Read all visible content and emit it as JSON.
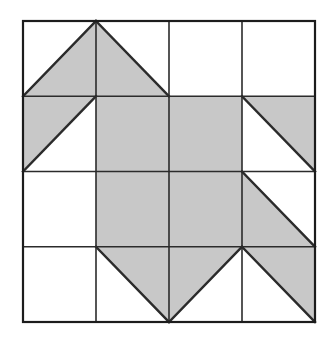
{
  "figure": {
    "type": "geometric-grid-diagram",
    "canvas": {
      "width": 333,
      "height": 337
    },
    "colors": {
      "background": "#ffffff",
      "shade_fill": "#c8c8c8",
      "blank_fill": "#ffffff",
      "stroke": "#2b2b2b",
      "outer_stroke": "#1c1c1c"
    },
    "grid": {
      "rows": 4,
      "cols": 4,
      "x_left": 23,
      "y_top": 21,
      "x_right": 315,
      "y_bottom": 322,
      "cell_width": 73,
      "cell_height": 75.25,
      "x_lines": [
        23,
        96,
        169,
        242,
        315
      ],
      "y_lines": [
        21,
        96.25,
        171.5,
        246.75,
        322
      ],
      "outer_stroke_width": 2.2,
      "inner_stroke_width": 1.6,
      "diagonal_stroke_width": 2.4
    },
    "legend": {
      "blank": "unshaded cell",
      "full": "fully shaded cell",
      "tri_nw": "diagonal from top-left to bottom-right, lower-left triangle shaded",
      "tri_ne": "diagonal from bottom-left to top-right, lower-right triangle shaded",
      "tri_se": "diagonal from bottom-left to top-right, upper-left triangle shaded",
      "tri_sw": "diagonal from top-left to bottom-right, upper-right triangle shaded"
    },
    "cells": [
      [
        {
          "row": 1,
          "col": 1,
          "kind": "tri-ne",
          "shaded": "lower-right",
          "diagonal": "bl-tr"
        },
        {
          "row": 1,
          "col": 2,
          "kind": "tri-nw",
          "shaded": "lower-left",
          "diagonal": "tl-br"
        },
        {
          "row": 1,
          "col": 3,
          "kind": "blank",
          "shaded": "none",
          "diagonal": "none"
        },
        {
          "row": 1,
          "col": 4,
          "kind": "blank",
          "shaded": "none",
          "diagonal": "none"
        }
      ],
      [
        {
          "row": 2,
          "col": 1,
          "kind": "tri-se",
          "shaded": "upper-right",
          "diagonal": "bl-tr"
        },
        {
          "row": 2,
          "col": 2,
          "kind": "full",
          "shaded": "all",
          "diagonal": "none"
        },
        {
          "row": 2,
          "col": 3,
          "kind": "full",
          "shaded": "all",
          "diagonal": "none"
        },
        {
          "row": 2,
          "col": 4,
          "kind": "tri-sw",
          "shaded": "upper-left",
          "diagonal": "tl-br"
        }
      ],
      [
        {
          "row": 3,
          "col": 1,
          "kind": "blank",
          "shaded": "none",
          "diagonal": "none"
        },
        {
          "row": 3,
          "col": 2,
          "kind": "full",
          "shaded": "all",
          "diagonal": "none"
        },
        {
          "row": 3,
          "col": 3,
          "kind": "full",
          "shaded": "all",
          "diagonal": "none"
        },
        {
          "row": 3,
          "col": 4,
          "kind": "tri-nw",
          "shaded": "lower-left",
          "diagonal": "tl-br"
        }
      ],
      [
        {
          "row": 4,
          "col": 1,
          "kind": "blank",
          "shaded": "none",
          "diagonal": "none"
        },
        {
          "row": 4,
          "col": 2,
          "kind": "tri-sw",
          "shaded": "upper-left",
          "diagonal": "tl-br"
        },
        {
          "row": 4,
          "col": 3,
          "kind": "tri-se",
          "shaded": "upper-right",
          "diagonal": "bl-tr"
        },
        {
          "row": 4,
          "col": 4,
          "kind": "tri-sw",
          "shaded": "upper-left",
          "diagonal": "tl-br"
        }
      ]
    ]
  }
}
